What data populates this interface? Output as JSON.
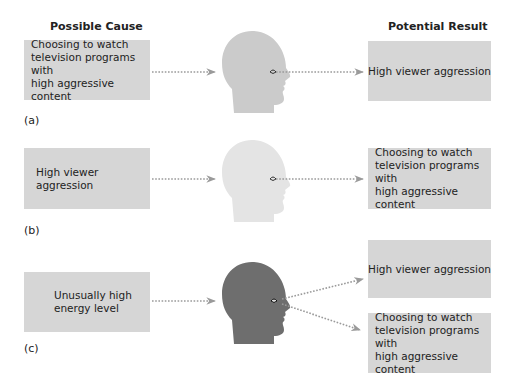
{
  "headers": {
    "cause": "Possible Cause",
    "result": "Potential Result"
  },
  "panels": [
    {
      "label": "(a)",
      "cause": "Choosing to watch\ntelevision programs with\nhigh aggressive content",
      "head_color": "#c9c9c9",
      "results": [
        "High viewer aggression"
      ]
    },
    {
      "label": "(b)",
      "cause": "High viewer aggression",
      "head_color": "#e2e2e2",
      "results": [
        "Choosing to watch\ntelevision programs with\nhigh aggressive content"
      ]
    },
    {
      "label": "(c)",
      "cause": "Unusually high\nenergy level",
      "head_color": "#6e6e6e",
      "results": [
        "High viewer aggression",
        "Choosing to watch\ntelevision programs with\nhigh aggressive content"
      ]
    }
  ],
  "colors": {
    "box_fill": "#d6d6d6",
    "arrow": "#9a9a9a",
    "text": "#222222"
  }
}
